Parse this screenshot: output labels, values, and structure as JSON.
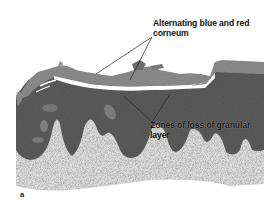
{
  "figure": {
    "panel_letter": "a",
    "annotations": [
      {
        "id": "corneum",
        "line1": "Alternating blue and red",
        "line2": "corneum"
      },
      {
        "id": "granular",
        "line1": "Zones of loss of granular",
        "line2": "layer"
      }
    ],
    "colors": {
      "background": "#ffffff",
      "epidermis": "#5a5a5a",
      "dermis": "#d8d8d8",
      "corneum": "#8a8a8a",
      "annotation_text": "#111111",
      "leader_line": "#222222"
    }
  }
}
